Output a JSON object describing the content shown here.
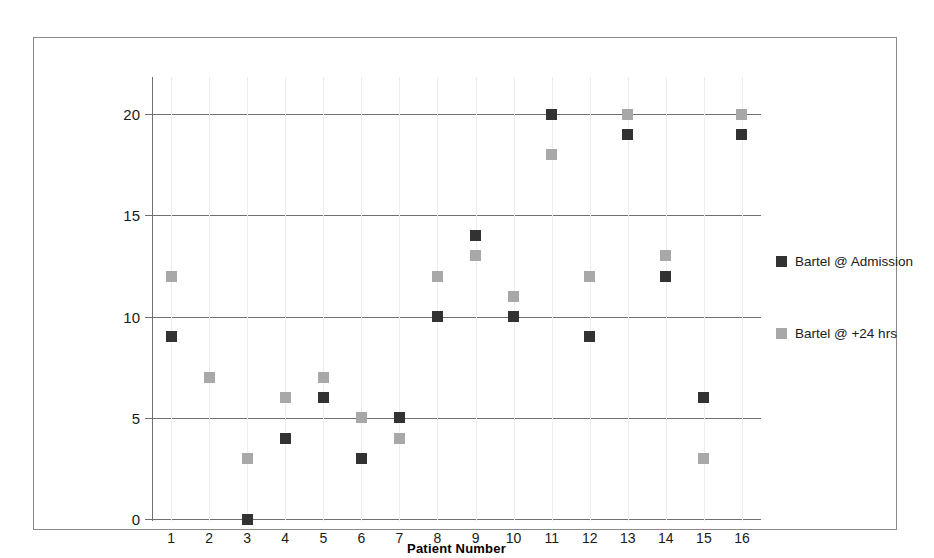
{
  "chart_data": {
    "type": "scatter",
    "title": "",
    "xlabel": "Patient Number",
    "ylabel": "",
    "categories": [
      "1",
      "2",
      "3",
      "4",
      "5",
      "6",
      "7",
      "8",
      "9",
      "10",
      "11",
      "12",
      "13",
      "14",
      "15",
      "16"
    ],
    "x": [
      1,
      2,
      3,
      4,
      5,
      6,
      7,
      8,
      9,
      10,
      11,
      12,
      13,
      14,
      15,
      16
    ],
    "series": [
      {
        "name": "Bartel @ Admission",
        "color": "#323232",
        "marker": "square",
        "values": [
          9,
          null,
          0,
          4,
          6,
          3,
          5,
          10,
          14,
          10,
          20,
          9,
          19,
          12,
          6,
          19
        ]
      },
      {
        "name": "Bartel @ +24 hrs",
        "color": "#a8a8a8",
        "marker": "square",
        "values": [
          12,
          7,
          3,
          6,
          7,
          5,
          4,
          12,
          13,
          11,
          18,
          12,
          20,
          13,
          3,
          20
        ]
      }
    ],
    "ylim": [
      0,
      21
    ],
    "yticks": [
      0,
      5,
      10,
      15,
      20
    ],
    "ytick_labels": [
      "0",
      "5",
      "10",
      "15",
      "20"
    ],
    "xlim": [
      0.5,
      16.5
    ],
    "grid": "horizontal",
    "legend_position": "right",
    "border": true
  },
  "axis": {
    "y_tick_labels": [
      "20",
      "15",
      "10",
      "5",
      "0"
    ],
    "x_tick_labels": [
      "1",
      "2",
      "3",
      "4",
      "5",
      "6",
      "7",
      "8",
      "9",
      "10",
      "11",
      "12",
      "13",
      "14",
      "15",
      "16"
    ],
    "x_title": "Patient Number"
  },
  "legend": {
    "items": [
      {
        "label": "Bartel @ Admission",
        "color": "#323232"
      },
      {
        "label": "Bartel @ +24 hrs",
        "color": "#a8a8a8"
      }
    ]
  },
  "colors": {
    "series_admission": "#323232",
    "series_24hrs": "#a8a8a8",
    "gridline": "#6f6f6f",
    "frame": "#8a8a8a",
    "dropline": "#ededed"
  }
}
